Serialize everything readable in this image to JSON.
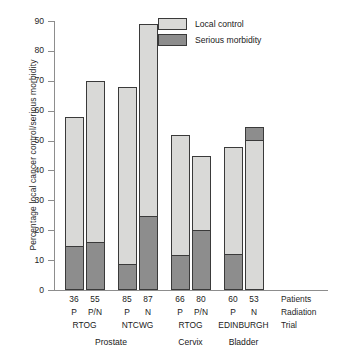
{
  "chart_data": {
    "type": "bar",
    "title": "",
    "subtitle": "",
    "xlabel": "",
    "ylabel": "Percentage local cancer control/serious morbidity",
    "ylim": [
      0,
      90
    ],
    "yticks": [
      0,
      10,
      20,
      30,
      40,
      50,
      60,
      70,
      80,
      90
    ],
    "grid": false,
    "legend_position": "top-right",
    "legend": [
      "Local control",
      "Serious morbidity"
    ],
    "colors": {
      "local_control": "#d9d9d7",
      "serious_morbidity": "#8d8d8d",
      "outline": "#3a3a3a",
      "axis": "#8d8d8d"
    },
    "row_labels": [
      "Patients",
      "Radiation",
      "Trial"
    ],
    "categories": [
      "RTOG P (Prostate)",
      "RTOG P/N (Prostate)",
      "NTCWG P (Prostate)",
      "NTCWG N (Prostate)",
      "RTOG P (Cervix)",
      "RTOG P/N (Cervix)",
      "EDINBURGH P (Bladder)",
      "EDINBURGH N (Bladder)"
    ],
    "series": [
      {
        "name": "Local control",
        "values": [
          58,
          70,
          68,
          89,
          52,
          45,
          48,
          54.5
        ]
      },
      {
        "name": "Serious morbidity",
        "values": [
          14,
          15.3,
          8,
          24,
          11,
          19.5,
          11.3,
          4
        ]
      }
    ],
    "bars": [
      {
        "patients": "36",
        "radiation": "P",
        "trial": "RTOG",
        "site": "Prostate",
        "local_control": 58,
        "serious_morbidity": 14,
        "morbidity_anchor": "bottom"
      },
      {
        "patients": "55",
        "radiation": "P/N",
        "trial": "RTOG",
        "site": "Prostate",
        "local_control": 70,
        "serious_morbidity": 15.3,
        "morbidity_anchor": "bottom"
      },
      {
        "patients": "85",
        "radiation": "P",
        "trial": "NTCWG",
        "site": "Prostate",
        "local_control": 68,
        "serious_morbidity": 8,
        "morbidity_anchor": "bottom"
      },
      {
        "patients": "87",
        "radiation": "N",
        "trial": "NTCWG",
        "site": "Prostate",
        "local_control": 89,
        "serious_morbidity": 24,
        "morbidity_anchor": "bottom"
      },
      {
        "patients": "66",
        "radiation": "P",
        "trial": "RTOG",
        "site": "Cervix",
        "local_control": 52,
        "serious_morbidity": 11,
        "morbidity_anchor": "bottom"
      },
      {
        "patients": "80",
        "radiation": "P/N",
        "trial": "RTOG",
        "site": "Cervix",
        "local_control": 45,
        "serious_morbidity": 19.5,
        "morbidity_anchor": "bottom"
      },
      {
        "patients": "60",
        "radiation": "P",
        "trial": "EDINBURGH",
        "site": "Bladder",
        "local_control": 48,
        "serious_morbidity": 11.3,
        "morbidity_anchor": "bottom"
      },
      {
        "patients": "53",
        "radiation": "N",
        "trial": "EDINBURGH",
        "site": "Bladder",
        "local_control": 54.5,
        "serious_morbidity": 4,
        "morbidity_anchor": "top"
      }
    ],
    "trial_groups": [
      {
        "label": "RTOG",
        "bars": [
          0,
          1
        ]
      },
      {
        "label": "NTCWG",
        "bars": [
          2,
          3
        ]
      },
      {
        "label": "RTOG",
        "bars": [
          4,
          5
        ]
      },
      {
        "label": "EDINBURGH",
        "bars": [
          6,
          7
        ]
      }
    ],
    "site_groups": [
      {
        "label": "Prostate",
        "bars": [
          0,
          1,
          2,
          3
        ]
      },
      {
        "label": "Cervix",
        "bars": [
          4,
          5
        ]
      },
      {
        "label": "Bladder",
        "bars": [
          6,
          7
        ]
      }
    ]
  }
}
